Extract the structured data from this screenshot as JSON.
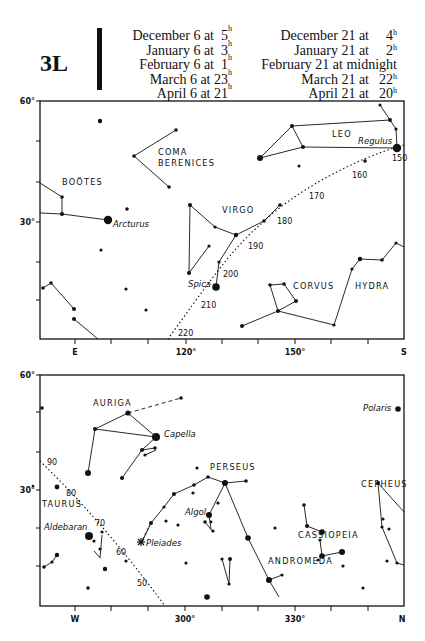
{
  "plate": {
    "id": "3L",
    "times_left": [
      {
        "label": "December 6 at",
        "time": "5",
        "unit": "h"
      },
      {
        "label": "January 6 at",
        "time": "3",
        "unit": "h"
      },
      {
        "label": "February 6 at",
        "time": "1",
        "unit": "h"
      },
      {
        "label": "March 6 at",
        "time": "23",
        "unit": "h"
      },
      {
        "label": "April 6 at",
        "time": "21",
        "unit": "h"
      }
    ],
    "times_right": [
      {
        "label": "December 21 at",
        "time": "4",
        "unit": "h"
      },
      {
        "label": "January 21 at",
        "time": "2",
        "unit": "h"
      },
      {
        "label": "February 21 at midnight",
        "time": "",
        "unit": ""
      },
      {
        "label": "March 21 at",
        "time": "22",
        "unit": "h"
      },
      {
        "label": "April 21 at",
        "time": "20",
        "unit": "h"
      }
    ]
  },
  "colors": {
    "ink": "#111111",
    "paper": "#ffffff"
  },
  "top_chart": {
    "frame": {
      "x": 40,
      "y": 101,
      "w": 364,
      "h": 238
    },
    "y_labels": [
      {
        "text": "60°",
        "y": 101
      },
      {
        "text": "30°",
        "y": 222
      }
    ],
    "y_ticks": [
      101,
      141,
      182,
      222,
      262,
      300
    ],
    "x_ticks": [
      75,
      111,
      148,
      186,
      222,
      258,
      295,
      331,
      368
    ],
    "x_labels": [
      {
        "text": "E",
        "x": 75
      },
      {
        "text": "120°",
        "x": 186
      },
      {
        "text": "150°",
        "x": 295
      },
      {
        "text": "S",
        "x": 404
      }
    ],
    "constellations": [
      {
        "name": "BOÖTES",
        "x": 62,
        "y": 185
      },
      {
        "name": "COMA",
        "x": 158,
        "y": 155
      },
      {
        "name": "BERENICES",
        "x": 158,
        "y": 166
      },
      {
        "name": "VIRGO",
        "x": 222,
        "y": 213
      },
      {
        "name": "LEO",
        "x": 332,
        "y": 137
      },
      {
        "name": "CORVUS",
        "x": 293,
        "y": 289
      },
      {
        "name": "HYDRA",
        "x": 355,
        "y": 289
      }
    ],
    "star_names": [
      {
        "name": "Arcturus",
        "x": 113,
        "y": 227
      },
      {
        "name": "Regulus",
        "x": 358,
        "y": 144
      },
      {
        "name": "Spica",
        "x": 188,
        "y": 287
      }
    ],
    "ecliptic_labels": [
      {
        "text": "150",
        "x": 392,
        "y": 161
      },
      {
        "text": "160",
        "x": 352,
        "y": 178
      },
      {
        "text": "170",
        "x": 309,
        "y": 199
      },
      {
        "text": "180",
        "x": 277,
        "y": 224
      },
      {
        "text": "190",
        "x": 248,
        "y": 249
      },
      {
        "text": "200",
        "x": 223,
        "y": 277
      },
      {
        "text": "210",
        "x": 201,
        "y": 308
      },
      {
        "text": "220",
        "x": 178,
        "y": 336
      }
    ]
  },
  "bottom_chart": {
    "frame": {
      "x": 40,
      "y": 375,
      "w": 364,
      "h": 231
    },
    "y_labels": [
      {
        "text": "60°",
        "y": 375
      },
      {
        "text": "30°",
        "y": 490
      }
    ],
    "y_ticks": [
      375,
      412,
      452,
      490,
      528,
      566
    ],
    "x_ticks": [
      75,
      111,
      148,
      185,
      222,
      258,
      295,
      331,
      368
    ],
    "x_labels": [
      {
        "text": "W",
        "x": 75
      },
      {
        "text": "300°",
        "x": 185
      },
      {
        "text": "330°",
        "x": 295
      },
      {
        "text": "N",
        "x": 402
      }
    ],
    "constellations": [
      {
        "name": "AURIGA",
        "x": 93,
        "y": 406
      },
      {
        "name": "TAURUS",
        "x": 42,
        "y": 507
      },
      {
        "name": "PERSEUS",
        "x": 210,
        "y": 470
      },
      {
        "name": "CEPHEUS",
        "x": 361,
        "y": 487
      },
      {
        "name": "CASSIOPEIA",
        "x": 298,
        "y": 538
      },
      {
        "name": "ANDROMEDA",
        "x": 268,
        "y": 564
      }
    ],
    "star_names": [
      {
        "name": "Capella",
        "x": 164,
        "y": 437
      },
      {
        "name": "Polaris",
        "x": 363,
        "y": 411
      },
      {
        "name": "Algol",
        "x": 185,
        "y": 515
      },
      {
        "name": "Aldebaran",
        "x": 44,
        "y": 530
      },
      {
        "name": "Pleiades",
        "x": 146,
        "y": 546
      }
    ],
    "ecliptic_labels": [
      {
        "text": "90",
        "x": 47,
        "y": 465
      },
      {
        "text": "80",
        "x": 66,
        "y": 496
      },
      {
        "text": "70",
        "x": 95,
        "y": 526
      },
      {
        "text": "60",
        "x": 116,
        "y": 555
      },
      {
        "text": "50",
        "x": 137,
        "y": 586
      }
    ]
  }
}
